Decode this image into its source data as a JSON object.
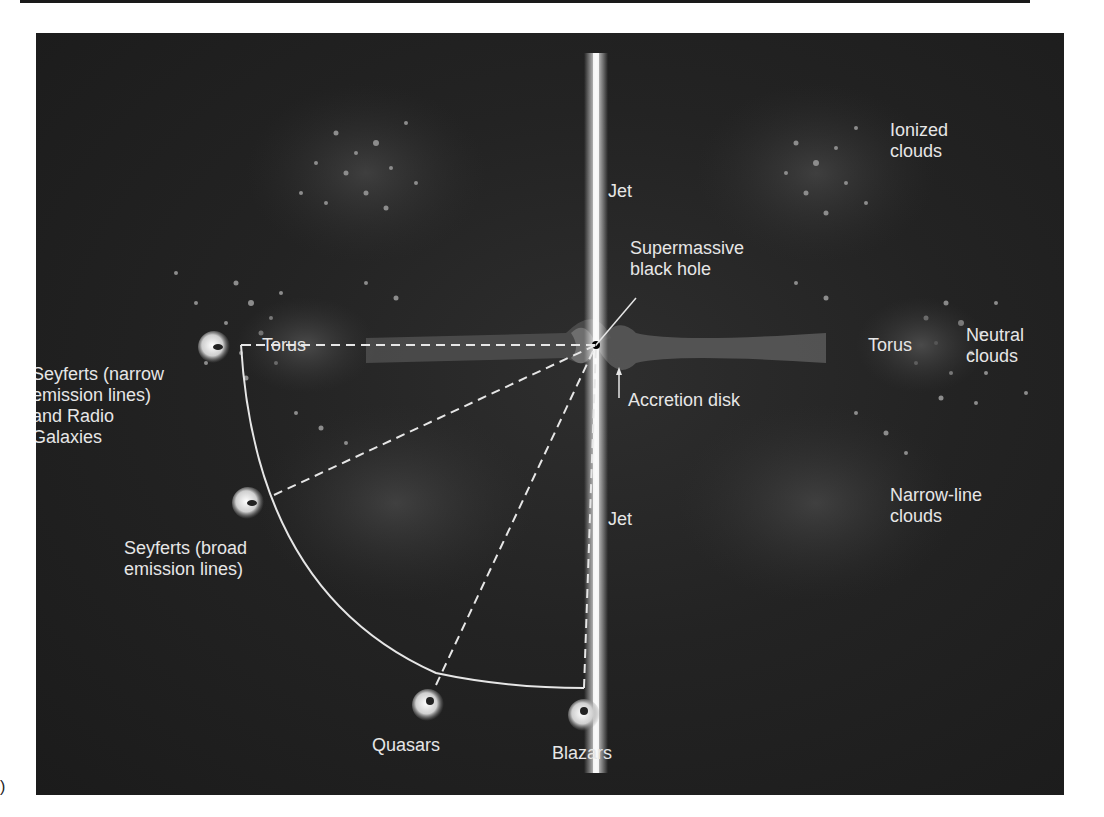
{
  "figure": {
    "panel_letter": ")"
  },
  "structures": {
    "jet_top": "Jet",
    "jet_bottom": "Jet",
    "black_hole": "Supermassive\nblack hole",
    "accretion_disk": "Accretion disk",
    "torus_left": "Torus",
    "torus_right": "Torus",
    "ionized_clouds": "Ionized\nclouds",
    "neutral_clouds": "Neutral\nclouds",
    "narrow_line_clouds": "Narrow-line\nclouds"
  },
  "observers": [
    {
      "id": "seyferts-narrow",
      "label": "Seyferts (narrow\nemission lines)\nand Radio\nGalaxies",
      "viewing_angle": "edge-on"
    },
    {
      "id": "seyferts-broad",
      "label": "Seyferts (broad\nemission lines)",
      "viewing_angle": "intermediate"
    },
    {
      "id": "quasars",
      "label": "Quasars",
      "viewing_angle": "steep"
    },
    {
      "id": "blazars",
      "label": "Blazars",
      "viewing_angle": "down the jet"
    }
  ],
  "colors": {
    "background": "#1f1f1f",
    "text": "#e6e6e6",
    "clouds": "#8a8a8a",
    "torus": "#3c3c3c",
    "disk": "#6e6e6e",
    "jet": "#f2f2f2"
  }
}
